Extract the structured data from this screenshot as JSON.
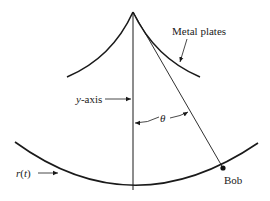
{
  "diagram": {
    "labels": {
      "metal_plates": "Metal plates",
      "y_axis_var": "y",
      "y_axis_suffix": "-axis",
      "theta": "θ",
      "r_t_var": "r",
      "r_t_paren_open": "(",
      "r_t_arg": "t",
      "r_t_paren_close": ")",
      "bob": "Bob"
    },
    "colors": {
      "stroke": "#1a1a1a",
      "text": "#222222"
    }
  }
}
